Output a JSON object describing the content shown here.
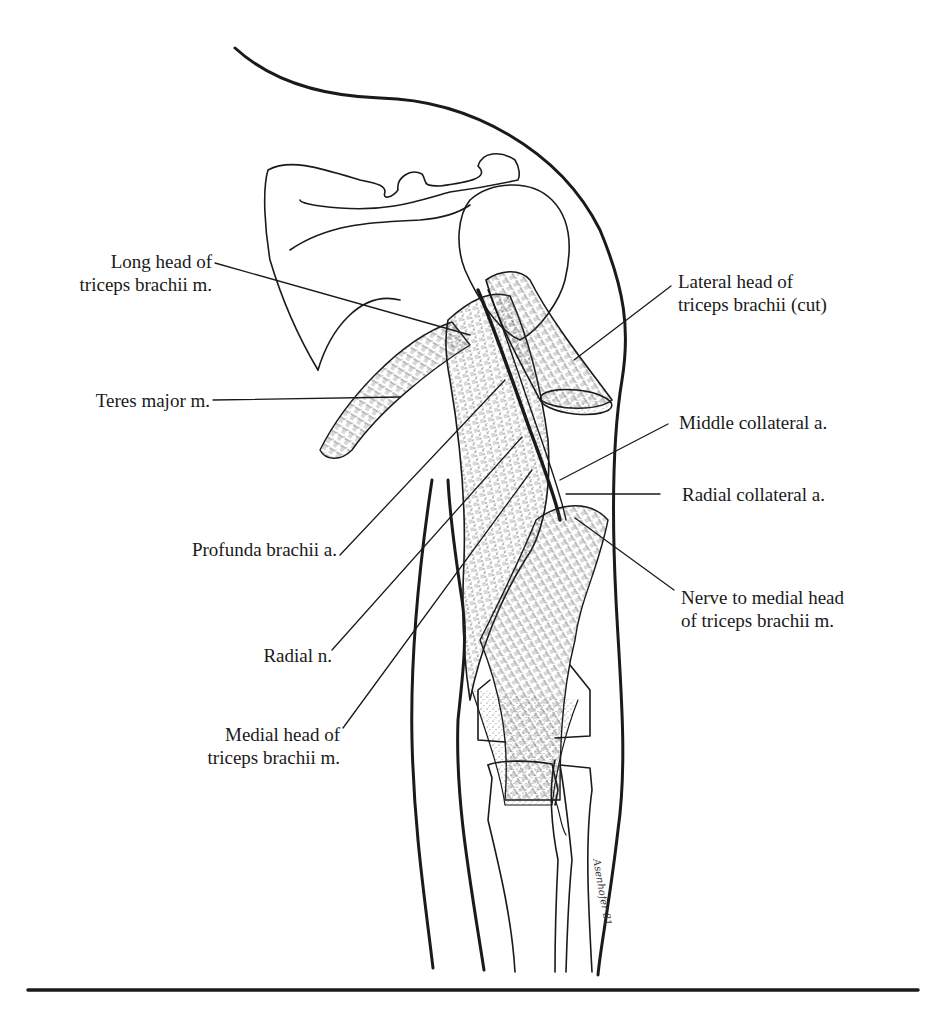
{
  "figure": {
    "line_color": "#1a1a1a",
    "background": "#ffffff",
    "signature": "Asenhofer 81"
  },
  "labels": {
    "long_head": [
      "Long head of",
      "triceps brachii m."
    ],
    "teres_major": [
      "Teres major m."
    ],
    "profunda_brachii": [
      "Profunda brachii a."
    ],
    "radial_n": [
      "Radial n."
    ],
    "medial_head": [
      "Medial head of",
      "triceps brachii m."
    ],
    "lateral_head": [
      "Lateral head of",
      "triceps brachii (cut)"
    ],
    "middle_collateral": [
      "Middle collateral a."
    ],
    "radial_collateral": [
      "Radial collateral a."
    ],
    "nerve_medial_head": [
      "Nerve to medial head",
      "of triceps brachii m."
    ]
  }
}
